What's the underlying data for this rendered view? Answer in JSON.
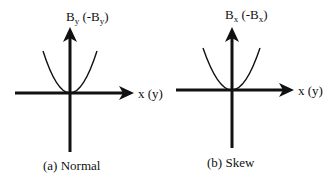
{
  "panels": [
    {
      "id": "a",
      "caption": "(a) Normal",
      "y_axis_label": {
        "main": "B",
        "sub": "y",
        "paren_open": " (-B",
        "paren_sub": "y",
        "paren_close": ")"
      },
      "x_axis_label": "x (y)",
      "curve": "parabola"
    },
    {
      "id": "b",
      "caption": "(b) Skew",
      "y_axis_label": {
        "main": "B",
        "sub": "x",
        "paren_open": " (-B",
        "paren_sub": "x",
        "paren_close": ")"
      },
      "x_axis_label": "x (y)",
      "curve": "parabola"
    }
  ],
  "colors": {
    "ink": "#111111",
    "background": "#ffffff"
  }
}
